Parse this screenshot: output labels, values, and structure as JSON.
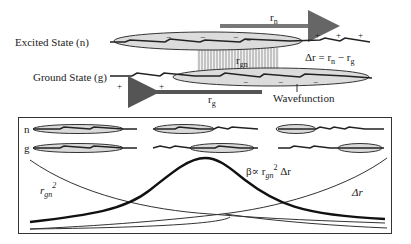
{
  "top": {
    "excited_label": "Excited State (n)",
    "ground_label": "Ground State (g)",
    "rn_label": "r",
    "rn_sub": "n",
    "rg_label": "r",
    "rg_sub": "g",
    "rgn_label": "r",
    "rgn_sub": "gn",
    "delta_eq": "Δr = r",
    "delta_eq_sub1": "n",
    "delta_eq_mid": " − r",
    "delta_eq_sub2": "g",
    "wavefunction_label": "Wavefunction",
    "plus": "+",
    "minus": "−"
  },
  "panel": {
    "row_n": "n",
    "row_g": "g",
    "rgn2_base": "r",
    "rgn2_sub": "gn",
    "rgn2_sup": "2",
    "beta_text": "β∝ r",
    "beta_sub": "gn",
    "beta_sup": "2",
    "beta_tail": " Δr",
    "delta_r": "Δr"
  },
  "colors": {
    "ink": "#222222",
    "cloud_fill": "#d9d9d9",
    "arrow": "#666666",
    "frame": "#333333"
  }
}
